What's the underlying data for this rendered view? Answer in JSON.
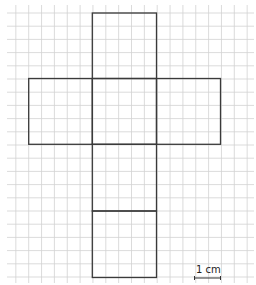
{
  "diagram": {
    "grid": {
      "x_start": 3.0,
      "x_step": 12.85,
      "x_count": 20,
      "y_start": 13.0,
      "y_step": 13.2,
      "y_count": 21,
      "line_color": "#d2d2d2",
      "extend_left": 7,
      "extend_right": 254,
      "extend_top": 5,
      "extend_bottom": 283
    },
    "net": {
      "stroke_color": "#3a3a3a",
      "stroke_width": 1.3,
      "faces": [
        {
          "name": "top-face",
          "x": 92.3,
          "y": 13.0,
          "w": 64.2,
          "h": 65.5
        },
        {
          "name": "left-face",
          "x": 28.7,
          "y": 78.5,
          "w": 63.6,
          "h": 65.8
        },
        {
          "name": "centre-face",
          "x": 92.3,
          "y": 78.5,
          "w": 64.2,
          "h": 65.8
        },
        {
          "name": "right-face",
          "x": 156.5,
          "y": 78.5,
          "w": 64.0,
          "h": 65.8
        },
        {
          "name": "lower-face",
          "x": 92.3,
          "y": 144.3,
          "w": 64.2,
          "h": 66.7
        },
        {
          "name": "bottom-face",
          "x": 92.3,
          "y": 211.0,
          "w": 64.2,
          "h": 66.5
        }
      ]
    },
    "scale_bar": {
      "label": "1 cm",
      "x1": 194.5,
      "x2": 220.5,
      "y": 278,
      "tick_height": 4,
      "label_x": 196,
      "label_y": 265
    }
  }
}
